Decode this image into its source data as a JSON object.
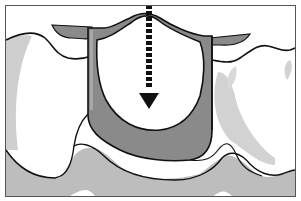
{
  "diagram": {
    "type": "illustration",
    "labels": [],
    "elements": [
      {
        "name": "crown",
        "description": "white dome-shaped crown in center"
      },
      {
        "name": "insertion-arrow",
        "description": "dashed black arrow pointing downward through crown"
      },
      {
        "name": "prepared-tooth-socket",
        "description": "dark gray U-shaped abutment surrounding crown"
      },
      {
        "name": "adjacent-teeth",
        "description": "white teeth on left and right with wavy outlines"
      },
      {
        "name": "gingiva",
        "description": "light gray gum tissue band at bottom"
      }
    ],
    "colors": {
      "background": "#ffffff",
      "outline": "#111111",
      "dark_gray": "#8a8a8a",
      "light_gray": "#bdbdbd",
      "shadow_gray": "#d4d4d4",
      "frame": "#555555"
    }
  }
}
